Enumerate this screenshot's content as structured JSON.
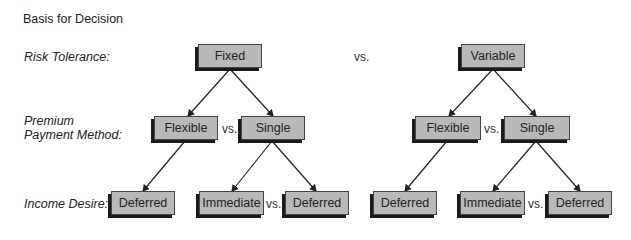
{
  "title": "Basis for Decision",
  "row_labels": {
    "risk": "Risk Tolerance:",
    "premium_line1": "Premium",
    "premium_line2": "Payment Method:",
    "income": "Income Desire:"
  },
  "vs_label": "vs.",
  "trees": [
    {
      "root": "Fixed",
      "level2": [
        "Flexible",
        "Single"
      ],
      "level3": [
        "Deferred",
        "Immediate",
        "Deferred"
      ]
    },
    {
      "root": "Variable",
      "level2": [
        "Flexible",
        "Single"
      ],
      "level3": [
        "Deferred",
        "Immediate",
        "Deferred"
      ]
    }
  ]
}
